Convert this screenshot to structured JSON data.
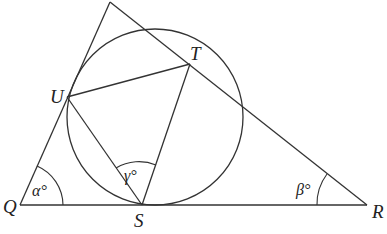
{
  "diagram": {
    "type": "geometry",
    "points": {
      "P": {
        "label": "P",
        "x": 110,
        "y": 2
      },
      "Q": {
        "label": "Q",
        "x": 20,
        "y": 205
      },
      "R": {
        "label": "R",
        "x": 367,
        "y": 205
      },
      "S": {
        "label": "S",
        "x": 142,
        "y": 205
      },
      "T": {
        "label": "T",
        "x": 190,
        "y": 64
      },
      "U": {
        "label": "U",
        "x": 67,
        "y": 97
      }
    },
    "circle": {
      "cx": 155,
      "cy": 117,
      "r": 88
    },
    "angles": {
      "alpha": {
        "label": "α°",
        "vertex": "Q"
      },
      "beta": {
        "label": "β°",
        "vertex": "R"
      },
      "gamma": {
        "label": "γ°",
        "vertex": "S"
      }
    },
    "labels": {
      "U": "U",
      "T": "T",
      "Q": "Q",
      "S": "S",
      "R": "R",
      "P": "P"
    }
  }
}
